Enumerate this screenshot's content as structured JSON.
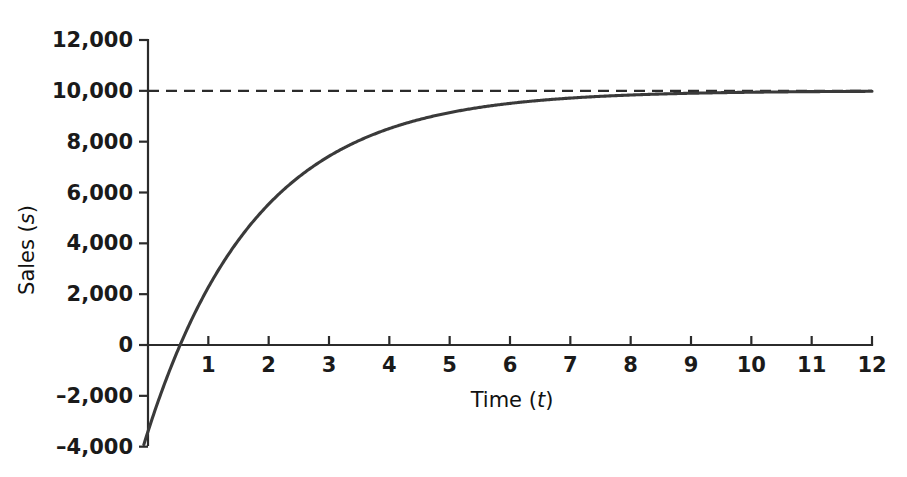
{
  "chart_data": {
    "type": "line",
    "title": "",
    "subtitle": "",
    "xlabel": "Time",
    "xlabel_symbol": "t",
    "ylabel": "Sales",
    "ylabel_symbol": "s",
    "xlim": [
      -0.15,
      12
    ],
    "ylim": [
      -4000,
      12000
    ],
    "grid": false,
    "legend": "none",
    "x_ticks": [
      0,
      1,
      2,
      3,
      4,
      5,
      6,
      7,
      8,
      9,
      10,
      11,
      12
    ],
    "x_tick_labels": [
      "0",
      "1",
      "2",
      "3",
      "4",
      "5",
      "6",
      "7",
      "8",
      "9",
      "10",
      "11",
      "12"
    ],
    "y_ticks": [
      -4000,
      -2000,
      0,
      2000,
      4000,
      6000,
      8000,
      10000,
      12000
    ],
    "y_tick_labels": [
      "–4,000",
      "–2,000",
      "0",
      "2,000",
      "4,000",
      "6,000",
      "8,000",
      "10,000",
      "12,000"
    ],
    "zero_x_tick_hidden": true,
    "series": [
      {
        "name": "Sales curve",
        "kind": "curve",
        "style": "solid",
        "color": "#3a3a3a",
        "formula": "s = 10000 - 13400 * exp(-0.55 * t)",
        "asymptote_value": 10000,
        "initial_value": -3400,
        "zero_crossing_t": 0.35,
        "x": [
          -0.1,
          0,
          0.35,
          0.5,
          1,
          1.5,
          2,
          2.5,
          3,
          3.5,
          4,
          4.5,
          5,
          5.5,
          6,
          6.5,
          7,
          7.5,
          8,
          8.5,
          9,
          9.5,
          10,
          10.5,
          11,
          11.5,
          12
        ],
        "values": [
          -4155,
          -3400,
          0,
          192,
          2268,
          4145,
          5540,
          6601,
          7406,
          8018,
          8483,
          8836,
          9104,
          9307,
          9462,
          9579,
          9680,
          9733,
          9797,
          9846,
          9880,
          9909,
          9931,
          9948,
          9961,
          9970,
          9978
        ]
      },
      {
        "name": "Asymptote",
        "kind": "horizontal-line",
        "style": "dashed",
        "color": "#2b2b2b",
        "value": 10000,
        "x_start": 0,
        "x_end": 12
      }
    ]
  },
  "figure": {
    "background_color": "#ffffff",
    "axis_color": "#2b2b2b",
    "curve_color": "#3a3a3a",
    "text_color": "#1a1a1a"
  }
}
